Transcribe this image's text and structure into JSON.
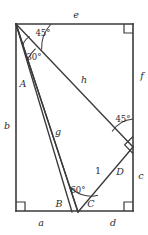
{
  "figure": {
    "kind": "geometry-diagram",
    "caption": "",
    "stroke_color": "#3a3a3a",
    "label_color": "#2b2b2b",
    "background": "#ffffff",
    "width": 148,
    "height": 235,
    "rectangle": {
      "top_left": [
        16,
        24
      ],
      "top_right": [
        133,
        24
      ],
      "bottom_right": [
        133,
        211
      ],
      "bottom_left": [
        16,
        211
      ]
    },
    "interior_points": {
      "apex_bottom": [
        78,
        212
      ],
      "right_vertex": [
        133,
        147
      ]
    },
    "side_labels": [
      {
        "name": "e",
        "text": "e",
        "x": 76,
        "y": 15
      },
      {
        "name": "f",
        "text": "f",
        "x": 142,
        "y": 76
      },
      {
        "name": "c",
        "text": "c",
        "x": 141,
        "y": 176
      },
      {
        "name": "d",
        "text": "d",
        "x": 113,
        "y": 223
      },
      {
        "name": "a",
        "text": "a",
        "x": 41,
        "y": 223
      },
      {
        "name": "b",
        "text": "b",
        "x": 7,
        "y": 126
      }
    ],
    "segment_labels": [
      {
        "name": "A",
        "text": "A",
        "x": 23,
        "y": 84
      },
      {
        "name": "h",
        "text": "h",
        "x": 84,
        "y": 80
      },
      {
        "name": "g",
        "text": "g",
        "x": 58,
        "y": 132
      },
      {
        "name": "B",
        "text": "B",
        "x": 59,
        "y": 204
      },
      {
        "name": "C",
        "text": "C",
        "x": 91,
        "y": 204
      },
      {
        "name": "D",
        "text": "D",
        "x": 120,
        "y": 172
      }
    ],
    "length_labels": [
      {
        "name": "one",
        "text": "1",
        "x": 98,
        "y": 171
      }
    ],
    "angle_labels": [
      {
        "name": "angle-45-top",
        "text": "45°",
        "x": 43,
        "y": 33
      },
      {
        "name": "angle-30-top",
        "text": "30°",
        "x": 34,
        "y": 57
      },
      {
        "name": "angle-45-right",
        "text": "45°",
        "x": 123,
        "y": 119
      },
      {
        "name": "angle-60-bottom",
        "text": "60°",
        "x": 78,
        "y": 190
      }
    ],
    "right_angle_markers": [
      {
        "name": "right-angle-top-right",
        "corner": [
          133,
          24
        ]
      },
      {
        "name": "right-angle-bottom-right",
        "corner": [
          133,
          211
        ]
      },
      {
        "name": "right-angle-bottom-left",
        "corner": [
          16,
          211
        ]
      },
      {
        "name": "right-angle-mid-right",
        "corner": [
          133,
          147
        ]
      }
    ]
  }
}
